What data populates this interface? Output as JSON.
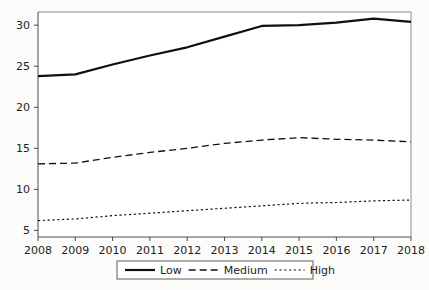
{
  "chart_data": {
    "type": "line",
    "title": "",
    "subtitle": "",
    "xlabel": "",
    "ylabel": "",
    "categories": [
      "2008",
      "2009",
      "2010",
      "2011",
      "2012",
      "2013",
      "2014",
      "2015",
      "2016",
      "2017",
      "2018"
    ],
    "x": [
      2008,
      2009,
      2010,
      2011,
      2012,
      2013,
      2014,
      2015,
      2016,
      2017,
      2018
    ],
    "series": [
      {
        "name": "Low",
        "style": "solid",
        "color": "#101010",
        "width": 2.2,
        "values": [
          23.8,
          24.0,
          25.2,
          26.3,
          27.3,
          28.6,
          29.9,
          30.0,
          30.3,
          30.8,
          30.4
        ]
      },
      {
        "name": "Medium",
        "style": "dashed",
        "color": "#101010",
        "width": 1.3,
        "values": [
          13.1,
          13.2,
          13.9,
          14.5,
          15.0,
          15.6,
          16.0,
          16.3,
          16.1,
          16.0,
          15.8
        ]
      },
      {
        "name": "High",
        "style": "dotted",
        "color": "#101010",
        "width": 1.2,
        "values": [
          6.2,
          6.4,
          6.8,
          7.1,
          7.4,
          7.7,
          8.0,
          8.3,
          8.4,
          8.6,
          8.7
        ]
      }
    ],
    "xlim": [
      2008,
      2018
    ],
    "ylim": [
      4.2,
      31.6
    ],
    "yticks": [
      5,
      10,
      15,
      20,
      25,
      30
    ],
    "ytick_labels": [
      "5",
      "10",
      "15",
      "20",
      "25",
      "30"
    ],
    "xtick_labels": [
      "2008",
      "2009",
      "2010",
      "2011",
      "2012",
      "2013",
      "2014",
      "2015",
      "2016",
      "2017",
      "2018"
    ],
    "grid": false,
    "legend_position": "bottom-center",
    "legend_entries": [
      {
        "label": "Low",
        "style": "solid"
      },
      {
        "label": "Medium",
        "style": "dashed"
      },
      {
        "label": "High",
        "style": "dotted"
      }
    ],
    "colors": {
      "background": "#fbfbfa",
      "plot_background": "#ffffff",
      "axis": "#4a4a4a",
      "frame": "#8d8d8d",
      "line": "#101010",
      "text": "#232323"
    }
  }
}
